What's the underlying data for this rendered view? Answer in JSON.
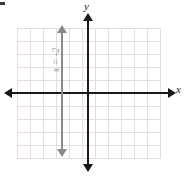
{
  "figure": {
    "axes": {
      "x_label": "x",
      "y_label": "y",
      "x_axis_color": "#1a1a1a",
      "y_axis_color": "#1a1a1a"
    },
    "grid": {
      "color": "#e6dcdc",
      "cell_size_px": 13,
      "columns": 11,
      "rows": 10,
      "visible": true
    },
    "plotted_line": {
      "label": "x = -2",
      "color": "#8a8a8a",
      "orientation": "vertical",
      "x_value": -2,
      "arrowheads": "both"
    }
  },
  "chart_data": {
    "type": "line",
    "title": "",
    "xlabel": "x",
    "ylabel": "y",
    "xlim": [
      -7,
      4
    ],
    "ylim": [
      -5,
      5
    ],
    "grid": true,
    "legend": "none",
    "series": [
      {
        "name": "x = -2",
        "equation": "x = -2",
        "x": [
          -2,
          -2
        ],
        "y": [
          -5,
          5
        ],
        "color": "#8a8a8a",
        "annotation": "x = -2"
      }
    ]
  }
}
